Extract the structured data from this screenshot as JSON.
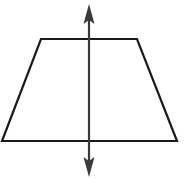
{
  "diagram": {
    "stroke_color": "#1a1a1a",
    "arrow_color": "#3a3a3a",
    "background": "#ffffff",
    "trapezoid": {
      "points": [
        [
          41,
          39
        ],
        [
          137,
          39
        ],
        [
          177,
          141
        ],
        [
          2,
          141
        ]
      ]
    },
    "symmetry_line": {
      "x": 89,
      "y_top": 4,
      "y_bottom": 177
    }
  }
}
